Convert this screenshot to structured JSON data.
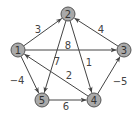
{
  "graph": {
    "nodes": [
      {
        "id": "1",
        "label": "1",
        "x": 18,
        "y": 50
      },
      {
        "id": "2",
        "label": "2",
        "x": 68,
        "y": 14
      },
      {
        "id": "3",
        "label": "3",
        "x": 124,
        "y": 50
      },
      {
        "id": "4",
        "label": "4",
        "x": 94,
        "y": 100
      },
      {
        "id": "5",
        "label": "5",
        "x": 42,
        "y": 100
      }
    ],
    "edges": [
      {
        "from": "1",
        "to": "2",
        "weight": "3",
        "lx": 38,
        "ly": 29
      },
      {
        "from": "1",
        "to": "3",
        "weight": "8",
        "lx": 68,
        "ly": 45
      },
      {
        "from": "3",
        "to": "2",
        "weight": "4",
        "lx": 101,
        "ly": 29
      },
      {
        "from": "2",
        "to": "5",
        "weight": "7",
        "lx": 57,
        "ly": 61
      },
      {
        "from": "2",
        "to": "4",
        "weight": "1",
        "lx": 89,
        "ly": 62
      },
      {
        "from": "4",
        "to": "1",
        "weight": "2",
        "lx": 69,
        "ly": 75
      },
      {
        "from": "1",
        "to": "5",
        "weight": "−4",
        "lx": 17,
        "ly": 80
      },
      {
        "from": "4",
        "to": "3",
        "weight": "−5",
        "lx": 120,
        "ly": 81
      },
      {
        "from": "5",
        "to": "4",
        "weight": "6",
        "lx": 66,
        "ly": 106
      }
    ],
    "node_radius": 7,
    "colors": {
      "node_fill": "#a9a9a9",
      "node_stroke": "#555555",
      "edge": "#444444"
    }
  }
}
